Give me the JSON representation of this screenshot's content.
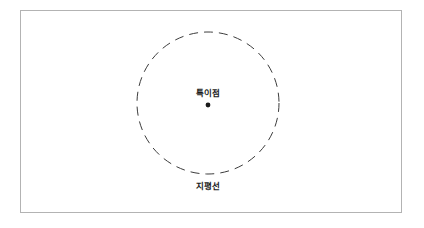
{
  "figure": {
    "background_color": "#ffffff",
    "frame": {
      "name": "diagram-frame",
      "border_color": "#b3b3b3",
      "x": 20,
      "y": 10,
      "width": 382,
      "height": 203
    },
    "event_horizon": {
      "label": "지평선",
      "shape": "dashed-circle",
      "stroke_color": "#3c3c3c",
      "center_x": 208,
      "center_y": 103,
      "radius": 71,
      "dash_length": 9,
      "dash_gap": 6,
      "stroke_width": 1
    },
    "singularity": {
      "label": "특이점",
      "shape": "dot",
      "color": "#1a1a1a",
      "center_x": 208,
      "center_y": 105,
      "radius": 2.4
    },
    "labels": {
      "singularity_label": "특이점",
      "horizon_label": "지평선"
    }
  }
}
